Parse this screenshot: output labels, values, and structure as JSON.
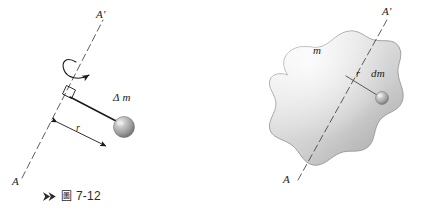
{
  "page": {
    "width": 421,
    "height": 218,
    "background": "#ffffff",
    "kind": "textbook-physics-figure-pair",
    "ink_color": "#1a1a1a"
  },
  "figure_left": {
    "id": "7-12",
    "subject": "point mass delta-m rotating about axis AA-prime at perpendicular distance r",
    "labels": {
      "axis_top": "A'",
      "axis_bottom": "A",
      "mass": "Δ m",
      "radius": "r"
    },
    "caption": {
      "marker": "double-chevron-marker",
      "cjk": "圖",
      "number": "7-12",
      "full": "圖 7-12"
    },
    "elements": {
      "axis_line_style": "dashed-thin",
      "rotation_arrow": "curved-arc-arrow-around-axis",
      "right_angle_mark": "small-square",
      "dimension_arrow": "double-headed",
      "sphere_fill_light": "#d8d8d8",
      "sphere_fill_dark": "#8a8a8a"
    }
  },
  "figure_right": {
    "id": "7-13",
    "subject": "rigid body of mass m with mass element dm at distance r from axis AA-prime",
    "labels": {
      "axis_top": "A'",
      "axis_bottom": "A",
      "body_mass": "m",
      "radius": "r",
      "mass_element": "dm"
    },
    "caption": {
      "marker": "double-chevron-marker",
      "cjk": "圖",
      "number": "7-13",
      "full": "圖 7-13"
    },
    "elements": {
      "axis_line_style": "dashed-thin",
      "blob_fill_light": "#f0f0f0",
      "blob_fill_mid": "#d5d5d5",
      "blob_fill_dark": "#a8a8a8",
      "blob_outline": "#9a9a9a",
      "sphere_fill_light": "#dcdcdc",
      "sphere_fill_dark": "#8f8f8f"
    }
  }
}
